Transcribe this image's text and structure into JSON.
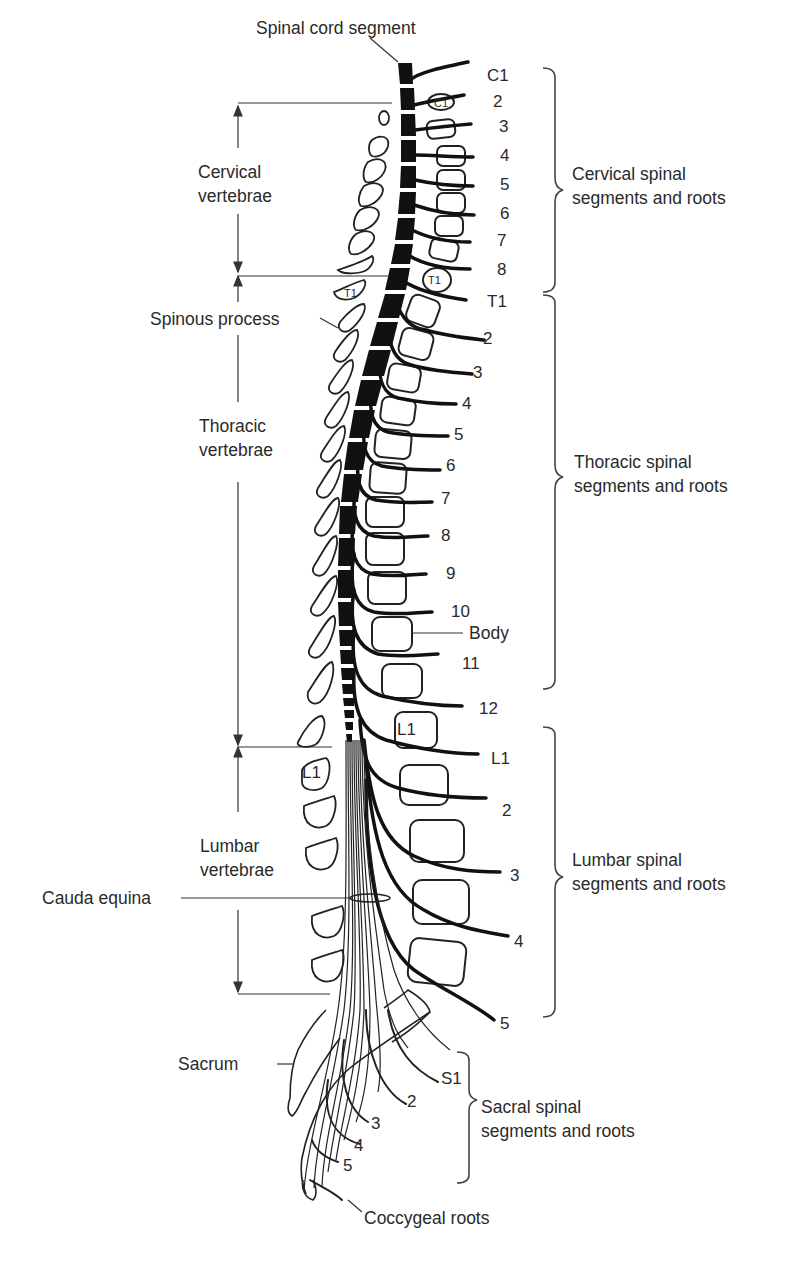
{
  "figure": {
    "title_label": "Spinal cord segment",
    "left_labels": {
      "cervical": [
        "Cervical",
        "vertebrae"
      ],
      "spinous": "Spinous process",
      "thoracic": [
        "Thoracic",
        "vertebrae"
      ],
      "lumbar": [
        "Lumbar",
        "vertebrae"
      ],
      "cauda": "Cauda equina",
      "sacrum": "Sacrum",
      "coccygeal": "Coccygeal roots"
    },
    "right_groups": {
      "cervical": [
        "Cervical spinal",
        "segments and roots"
      ],
      "thoracic": [
        "Thoracic spinal",
        "segments and roots"
      ],
      "lumbar": [
        "Lumbar spinal",
        "segments and roots"
      ],
      "sacral": [
        "Sacral spinal",
        "segments and roots"
      ]
    },
    "body_label": "Body",
    "vertebra_tags": {
      "c1": "C1",
      "t1": "T1",
      "l1": "L1"
    },
    "cervical_roots": [
      "C1",
      "2",
      "3",
      "4",
      "5",
      "6",
      "7",
      "8"
    ],
    "thoracic_roots": [
      "T1",
      "2",
      "3",
      "4",
      "5",
      "6",
      "7",
      "8",
      "9",
      "10",
      "11",
      "12"
    ],
    "lumbar_roots": [
      "L1",
      "2",
      "3",
      "4",
      "5"
    ],
    "sacral_roots": [
      "S1",
      "2",
      "3",
      "4",
      "5"
    ]
  }
}
